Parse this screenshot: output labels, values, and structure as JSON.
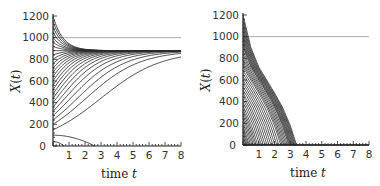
{
  "chart_data": [
    {
      "type": "line",
      "title": "",
      "xlabel": "time t",
      "ylabel": "X(t)",
      "xlim": [
        0,
        8
      ],
      "ylim": [
        0,
        1200
      ],
      "xticks": [
        "0",
        "1",
        "2",
        "3",
        "4",
        "5",
        "6",
        "7",
        "8"
      ],
      "yticks": [
        "0",
        "200",
        "400",
        "600",
        "800",
        "1000",
        "1200"
      ],
      "grid": false,
      "reference_line": {
        "y": 1000,
        "color": "#aaaaaa"
      },
      "description": "Family of trajectories X(t) from many initial conditions (0–1200). Trajectories starting above ~150 converge to a stable equilibrium near 880; two trajectories starting near 100 and 40 decay to 0 (extinction) by t≈2.6 and t≈0.6.",
      "equilibrium": 880,
      "series_initial_values": [
        1200,
        1150,
        1100,
        1050,
        1000,
        960,
        920,
        880,
        840,
        800,
        760,
        720,
        680,
        640,
        600,
        560,
        520,
        480,
        440,
        400,
        360,
        320,
        280,
        240,
        200,
        150,
        100,
        40
      ],
      "extinct_series": [
        {
          "x0": 100,
          "t_zero": 2.6
        },
        {
          "x0": 40,
          "t_zero": 0.7
        }
      ]
    },
    {
      "type": "line",
      "title": "",
      "xlabel": "time t",
      "ylabel": "X(t)",
      "xlim": [
        0,
        8
      ],
      "ylim": [
        0,
        1200
      ],
      "xticks": [
        "0",
        "1",
        "2",
        "3",
        "4",
        "5",
        "6",
        "7",
        "8"
      ],
      "yticks": [
        "0",
        "200",
        "400",
        "600",
        "800",
        "1000",
        "1200"
      ],
      "grid": false,
      "reference_line": {
        "y": 1000,
        "color": "#aaaaaa"
      },
      "description": "Family of trajectories X(t), all decreasing to 0; envelope from 1200 at t=0 reaches 0 at t≈3.4. Dense hatch of ~40 curves.",
      "envelope": {
        "x": [
          0,
          0.5,
          1,
          1.5,
          2,
          2.5,
          3,
          3.4
        ],
        "y": [
          1200,
          900,
          720,
          600,
          480,
          350,
          180,
          0
        ]
      }
    }
  ],
  "panels": {
    "left": {
      "xlabel": "time t",
      "ylabel": "X(t)"
    },
    "right": {
      "xlabel": "time t",
      "ylabel": "X(t)"
    }
  }
}
